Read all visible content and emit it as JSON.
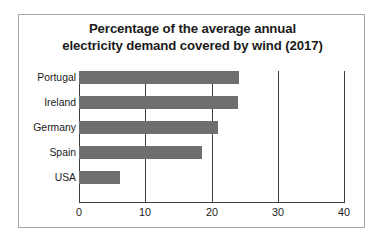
{
  "chart_data": {
    "type": "bar",
    "orientation": "horizontal",
    "title": "Percentage of the average annual electricity demand covered by wind (2017)",
    "title_lines": [
      "Percentage of the average annual",
      "electricity demand covered by wind (2017)"
    ],
    "categories": [
      "Portugal",
      "Ireland",
      "Germany",
      "Spain",
      "USA"
    ],
    "values": [
      24.1,
      24.0,
      21.0,
      18.5,
      6.2
    ],
    "xlabel": "",
    "ylabel": "",
    "xlim": [
      0,
      40
    ],
    "xticks": [
      0,
      10,
      20,
      30,
      40
    ],
    "xtick_labels": [
      "0",
      "10",
      "20",
      "30",
      "40"
    ],
    "grid": "vertical",
    "legend": "none",
    "bar_color": "#6e6e6e",
    "axis_color": "#3d3d3d",
    "text_color": "#1b1b1b",
    "frame_color": "#a6a6a6",
    "background": "#ffffff"
  }
}
